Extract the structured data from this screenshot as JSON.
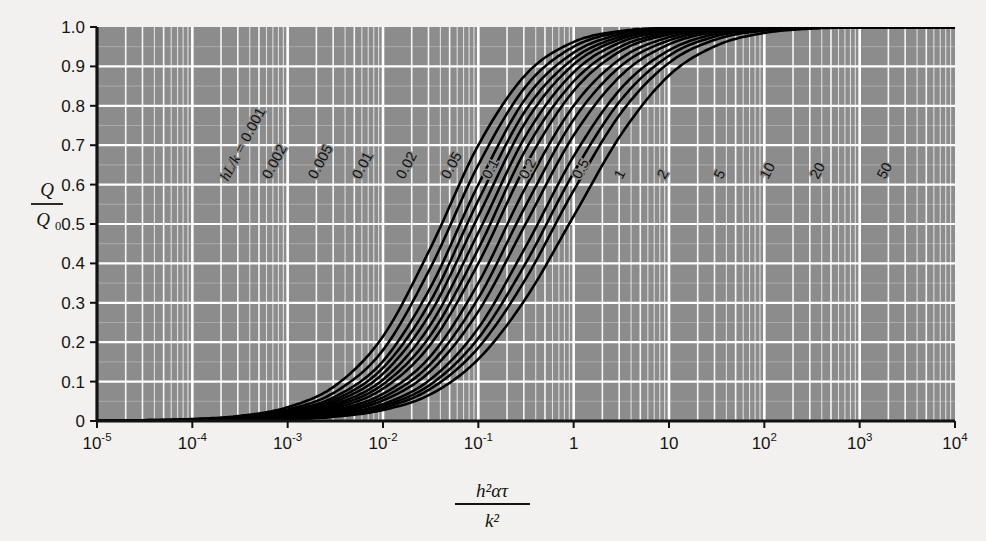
{
  "chart_data": {
    "type": "line",
    "title": "",
    "subtitle": "",
    "xlabel_parts": {
      "numerator": "h²ατ",
      "denominator": "k²",
      "plain": "h²ατ / k²"
    },
    "ylabel_parts": {
      "numerator": "Q",
      "denominator_base": "Q",
      "denominator_sub": "0",
      "plain": "Q / Q₀"
    },
    "xscale": "log",
    "yscale": "linear",
    "xlim": [
      1e-05,
      10000.0
    ],
    "ylim": [
      0,
      1.0
    ],
    "grid": "major and minor (log decade minors on x, 0.1 steps on y)",
    "legend": "inline curve labels",
    "legend_position": "inline along curves",
    "plot_background": "#8c8c8c",
    "grid_color": "#ffffff",
    "curve_color": "#000000",
    "xticks": [
      {
        "label_base": "10",
        "label_sup": "-5",
        "value": 1e-05
      },
      {
        "label_base": "10",
        "label_sup": "-4",
        "value": 0.0001
      },
      {
        "label_base": "10",
        "label_sup": "-3",
        "value": 0.001
      },
      {
        "label_base": "10",
        "label_sup": "-2",
        "value": 0.01
      },
      {
        "label_base": "10",
        "label_sup": "-1",
        "value": 0.1
      },
      {
        "label_base": "1",
        "label_sup": "",
        "value": 1
      },
      {
        "label_base": "10",
        "label_sup": "",
        "value": 10
      },
      {
        "label_base": "10",
        "label_sup": "2",
        "value": 100
      },
      {
        "label_base": "10",
        "label_sup": "3",
        "value": 1000
      },
      {
        "label_base": "10",
        "label_sup": "4",
        "value": 10000
      }
    ],
    "yticks": [
      "0",
      "0.1",
      "0.2",
      "0.3",
      "0.4",
      "0.5",
      "0.6",
      "0.7",
      "0.8",
      "0.9",
      "1.0"
    ],
    "ytick_values": [
      0,
      0.1,
      0.2,
      0.3,
      0.4,
      0.5,
      0.6,
      0.7,
      0.8,
      0.9,
      1.0
    ],
    "series_label_prefix": "hL/k = ",
    "series": [
      {
        "name": "0.001",
        "bi": 0.001,
        "label": "0.001",
        "show_prefix": true,
        "values": [
          0.0,
          0.002,
          0.005,
          0.013,
          0.035,
          0.09,
          0.215,
          0.44,
          0.7,
          0.88,
          0.962,
          0.99,
          0.998,
          1.0,
          1.0,
          1.0,
          1.0,
          1.0,
          1.0
        ]
      },
      {
        "name": "0.002",
        "bi": 0.002,
        "label": "0.002",
        "show_prefix": false,
        "values": [
          0.0,
          0.002,
          0.004,
          0.011,
          0.029,
          0.074,
          0.18,
          0.39,
          0.65,
          0.85,
          0.95,
          0.987,
          0.997,
          1.0,
          1.0,
          1.0,
          1.0,
          1.0,
          1.0
        ]
      },
      {
        "name": "0.005",
        "bi": 0.005,
        "label": "0.005",
        "show_prefix": false,
        "values": [
          0.0,
          0.001,
          0.004,
          0.01,
          0.025,
          0.062,
          0.152,
          0.34,
          0.6,
          0.82,
          0.935,
          0.982,
          0.996,
          1.0,
          1.0,
          1.0,
          1.0,
          1.0,
          1.0
        ]
      },
      {
        "name": "0.01",
        "bi": 0.01,
        "label": "0.01",
        "show_prefix": false,
        "values": [
          0.0,
          0.001,
          0.003,
          0.009,
          0.022,
          0.055,
          0.135,
          0.305,
          0.56,
          0.79,
          0.92,
          0.976,
          0.994,
          0.999,
          1.0,
          1.0,
          1.0,
          1.0,
          1.0
        ]
      },
      {
        "name": "0.02",
        "bi": 0.02,
        "label": "0.02",
        "show_prefix": false,
        "values": [
          0.0,
          0.001,
          0.003,
          0.008,
          0.02,
          0.049,
          0.12,
          0.275,
          0.52,
          0.76,
          0.905,
          0.97,
          0.992,
          0.999,
          1.0,
          1.0,
          1.0,
          1.0,
          1.0
        ]
      },
      {
        "name": "0.05",
        "bi": 0.05,
        "label": "0.05",
        "show_prefix": false,
        "values": [
          0.0,
          0.001,
          0.002,
          0.007,
          0.017,
          0.043,
          0.105,
          0.245,
          0.478,
          0.725,
          0.885,
          0.962,
          0.989,
          0.998,
          1.0,
          1.0,
          1.0,
          1.0,
          1.0
        ]
      },
      {
        "name": "0.1",
        "bi": 0.1,
        "label": "0.1",
        "show_prefix": false,
        "values": [
          0.0,
          0.001,
          0.002,
          0.006,
          0.015,
          0.038,
          0.093,
          0.218,
          0.437,
          0.69,
          0.862,
          0.951,
          0.985,
          0.997,
          1.0,
          1.0,
          1.0,
          1.0,
          1.0
        ]
      },
      {
        "name": "0.2",
        "bi": 0.2,
        "label": "0.2",
        "show_prefix": false,
        "values": [
          0.0,
          0.001,
          0.002,
          0.005,
          0.013,
          0.033,
          0.082,
          0.195,
          0.4,
          0.65,
          0.838,
          0.94,
          0.981,
          0.996,
          0.999,
          1.0,
          1.0,
          1.0,
          1.0
        ]
      },
      {
        "name": "0.5",
        "bi": 0.5,
        "label": "0.5",
        "show_prefix": false,
        "values": [
          0.0,
          0.001,
          0.002,
          0.004,
          0.011,
          0.028,
          0.069,
          0.165,
          0.35,
          0.595,
          0.8,
          0.921,
          0.974,
          0.994,
          0.999,
          1.0,
          1.0,
          1.0,
          1.0
        ]
      },
      {
        "name": "1",
        "bi": 1,
        "label": "1",
        "show_prefix": false,
        "values": [
          0.0,
          0.0,
          0.001,
          0.004,
          0.01,
          0.024,
          0.06,
          0.145,
          0.312,
          0.548,
          0.765,
          0.902,
          0.966,
          0.991,
          0.998,
          1.0,
          1.0,
          1.0,
          1.0
        ]
      },
      {
        "name": "2",
        "bi": 2,
        "label": "2",
        "show_prefix": false,
        "values": [
          0.0,
          0.0,
          0.001,
          0.003,
          0.008,
          0.021,
          0.052,
          0.127,
          0.278,
          0.502,
          0.725,
          0.878,
          0.956,
          0.988,
          0.997,
          1.0,
          1.0,
          1.0,
          1.0
        ]
      },
      {
        "name": "5",
        "bi": 5,
        "label": "5",
        "show_prefix": false,
        "values": [
          0.0,
          0.0,
          0.001,
          0.003,
          0.007,
          0.017,
          0.043,
          0.106,
          0.236,
          0.444,
          0.672,
          0.845,
          0.941,
          0.983,
          0.996,
          0.999,
          1.0,
          1.0,
          1.0
        ]
      },
      {
        "name": "10",
        "bi": 10,
        "label": "10",
        "show_prefix": false,
        "values": [
          0.0,
          0.0,
          0.001,
          0.002,
          0.006,
          0.015,
          0.038,
          0.093,
          0.21,
          0.402,
          0.63,
          0.816,
          0.927,
          0.977,
          0.994,
          0.999,
          1.0,
          1.0,
          1.0
        ]
      },
      {
        "name": "20",
        "bi": 20,
        "label": "20",
        "show_prefix": false,
        "values": [
          0.0,
          0.0,
          0.001,
          0.002,
          0.005,
          0.013,
          0.033,
          0.082,
          0.186,
          0.362,
          0.585,
          0.783,
          0.909,
          0.969,
          0.991,
          0.998,
          1.0,
          1.0,
          1.0
        ]
      },
      {
        "name": "50",
        "bi": 50,
        "label": "50",
        "show_prefix": false,
        "values": [
          0.0,
          0.0,
          0.0,
          0.002,
          0.004,
          0.011,
          0.028,
          0.068,
          0.157,
          0.312,
          0.52,
          0.728,
          0.877,
          0.953,
          0.985,
          0.996,
          0.999,
          1.0,
          1.0
        ]
      }
    ],
    "x_samples": [
      1e-05,
      3.162e-05,
      0.0001,
      0.0003162,
      0.001,
      0.003162,
      0.01,
      0.03162,
      0.1,
      0.3162,
      1,
      3.162,
      10,
      31.62,
      100,
      316.2,
      1000,
      3162,
      10000
    ],
    "curve_label_anchors": [
      {
        "name": "0.001",
        "x": 228,
        "y": 182
      },
      {
        "name": "0.002",
        "x": 270,
        "y": 180
      },
      {
        "name": "0.005",
        "x": 316,
        "y": 180
      },
      {
        "name": "0.01",
        "x": 360,
        "y": 180
      },
      {
        "name": "0.02",
        "x": 404,
        "y": 180
      },
      {
        "name": "0.05",
        "x": 449,
        "y": 180
      },
      {
        "name": "0.1",
        "x": 490,
        "y": 180
      },
      {
        "name": "0.2",
        "x": 527,
        "y": 180
      },
      {
        "name": "0.5",
        "x": 580,
        "y": 180
      },
      {
        "name": "1",
        "x": 622,
        "y": 180
      },
      {
        "name": "2",
        "x": 665,
        "y": 180
      },
      {
        "name": "5",
        "x": 722,
        "y": 180
      },
      {
        "name": "10",
        "x": 768,
        "y": 180
      },
      {
        "name": "20",
        "x": 818,
        "y": 180
      },
      {
        "name": "50",
        "x": 885,
        "y": 180
      }
    ]
  }
}
